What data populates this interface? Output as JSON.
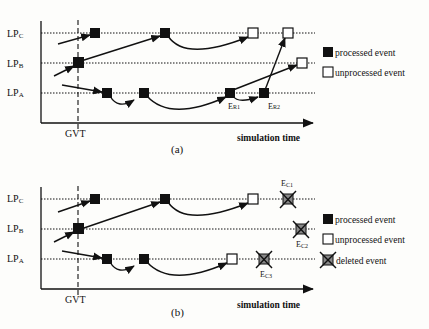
{
  "panel_a": {
    "caption": "(a)",
    "lanes": [
      {
        "main": "LP",
        "sub": "C"
      },
      {
        "main": "LP",
        "sub": "B"
      },
      {
        "main": "LP",
        "sub": "A"
      }
    ],
    "gvt": "GVT",
    "xlabel": "simulation time",
    "annotations": [
      {
        "main": "E",
        "sub": "R1"
      },
      {
        "main": "E",
        "sub": "R2"
      }
    ],
    "legend": [
      {
        "symbol": "processed-square",
        "label": "processed event"
      },
      {
        "symbol": "unprocessed-square",
        "label": "unprocessed event"
      }
    ]
  },
  "panel_b": {
    "caption": "(b)",
    "lanes": [
      {
        "main": "LP",
        "sub": "C"
      },
      {
        "main": "LP",
        "sub": "B"
      },
      {
        "main": "LP",
        "sub": "A"
      }
    ],
    "gvt": "GVT",
    "xlabel": "simulation time",
    "annotations": [
      {
        "main": "E",
        "sub": "C1"
      },
      {
        "main": "E",
        "sub": "C2"
      },
      {
        "main": "E",
        "sub": "C3"
      }
    ],
    "legend": [
      {
        "symbol": "processed-square",
        "label": "processed event"
      },
      {
        "symbol": "unprocessed-square",
        "label": "unprocessed event"
      },
      {
        "symbol": "deleted-cross",
        "label": "deleted event"
      }
    ]
  },
  "colors": {
    "ink": "#111111",
    "paper": "#fdfdfb"
  }
}
